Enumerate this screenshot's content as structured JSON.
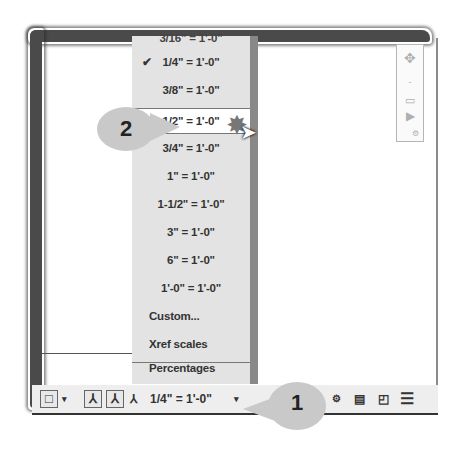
{
  "scale_menu": {
    "partial_top_item": "3/16\" = 1'-0\"",
    "items": [
      {
        "label": "1/4\" = 1'-0\"",
        "checked": true
      },
      {
        "label": "3/8\" = 1'-0\"",
        "checked": false
      },
      {
        "label": "1/2\" = 1'-0\"",
        "checked": false,
        "highlighted": true
      },
      {
        "label": "3/4\" = 1'-0\"",
        "checked": false
      },
      {
        "label": "1\" = 1'-0\"",
        "checked": false
      },
      {
        "label": "1-1/2\" = 1'-0\"",
        "checked": false
      },
      {
        "label": "3\" = 1'-0\"",
        "checked": false
      },
      {
        "label": "6\" = 1'-0\"",
        "checked": false
      },
      {
        "label": "1'-0\" = 1'-0\"",
        "checked": false
      },
      {
        "label": "Custom...",
        "checked": false
      }
    ],
    "extra_items": [
      {
        "label": "Xref scales"
      },
      {
        "label": "Percentages"
      }
    ],
    "check_glyph": "✔"
  },
  "statusbar": {
    "current_scale": "1/4\" = 1'-0\"",
    "dropdown_glyph": "▾",
    "icons": [
      "viewport-icon",
      "annotation-visibility-icon",
      "auto-scale-icon",
      "annotation-scale-icon",
      "workspace-icon",
      "isolate-icon",
      "fullscreen-icon",
      "customize-menu-icon"
    ]
  },
  "callouts": {
    "one": "1",
    "two": "2"
  }
}
